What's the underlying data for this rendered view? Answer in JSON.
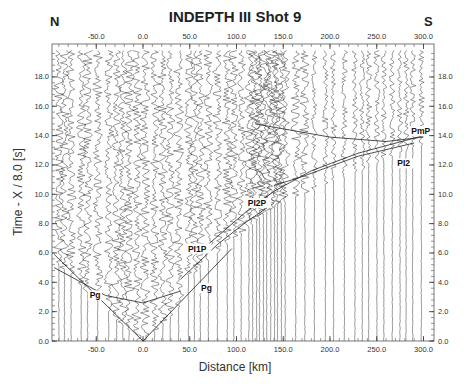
{
  "chart_data": {
    "type": "seismic-record-section",
    "title": "INDEPTH III   Shot 9",
    "direction_left": "N",
    "direction_right": "S",
    "xlabel": "Distance [km]",
    "ylabel": "Time - X / 8.0 [s]",
    "xlim": [
      -95,
      308
    ],
    "ylim": [
      0,
      20
    ],
    "x_ticks": [
      "-50.0",
      "0.0",
      "50.0",
      "100.0",
      "150.0",
      "200.0",
      "250.0",
      "300.0"
    ],
    "x_tick_values": [
      -50,
      0,
      50,
      100,
      150,
      200,
      250,
      300
    ],
    "y_ticks": [
      "0.0",
      "2.0",
      "4.0",
      "6.0",
      "8.0",
      "10.0",
      "12.0",
      "14.0",
      "16.0",
      "18.0"
    ],
    "y_tick_values": [
      0,
      2,
      4,
      6,
      8,
      10,
      12,
      14,
      16,
      18
    ],
    "reduction_velocity_km_s": 8.0,
    "phase_labels": [
      {
        "label": "Pg",
        "x": -57,
        "y": 2.9
      },
      {
        "label": "Pg",
        "x": 62,
        "y": 3.4
      },
      {
        "label": "PI1P",
        "x": 48,
        "y": 6.1
      },
      {
        "label": "PI2P",
        "x": 112,
        "y": 9.2
      },
      {
        "label": "PI2",
        "x": 272,
        "y": 11.9
      },
      {
        "label": "PmP",
        "x": 287,
        "y": 14.1
      }
    ],
    "travel_time_curves": [
      {
        "name": "Pg-north",
        "points": [
          [
            -95,
            5.9
          ],
          [
            0,
            0.0
          ]
        ]
      },
      {
        "name": "Pg-south",
        "points": [
          [
            0,
            0.0
          ],
          [
            95,
            6.3
          ]
        ]
      },
      {
        "name": "PI1P",
        "points": [
          [
            40,
            4.2
          ],
          [
            80,
            6.6
          ],
          [
            110,
            8.1
          ],
          [
            140,
            9.4
          ]
        ]
      },
      {
        "name": "PI2P",
        "points": [
          [
            70,
            6.6
          ],
          [
            110,
            8.8
          ],
          [
            140,
            10.2
          ],
          [
            180,
            11.6
          ],
          [
            230,
            12.8
          ],
          [
            300,
            14.0
          ]
        ]
      },
      {
        "name": "PI2",
        "points": [
          [
            140,
            10.6
          ],
          [
            170,
            11.2
          ],
          [
            230,
            12.6
          ],
          [
            290,
            13.5
          ]
        ]
      },
      {
        "name": "PmP",
        "points": [
          [
            120,
            14.8
          ],
          [
            200,
            13.9
          ],
          [
            260,
            13.6
          ],
          [
            300,
            13.9
          ]
        ]
      },
      {
        "name": "north-branch",
        "points": [
          [
            -95,
            5.0
          ],
          [
            -40,
            3.1
          ],
          [
            0,
            2.6
          ],
          [
            40,
            3.4
          ]
        ]
      }
    ]
  }
}
